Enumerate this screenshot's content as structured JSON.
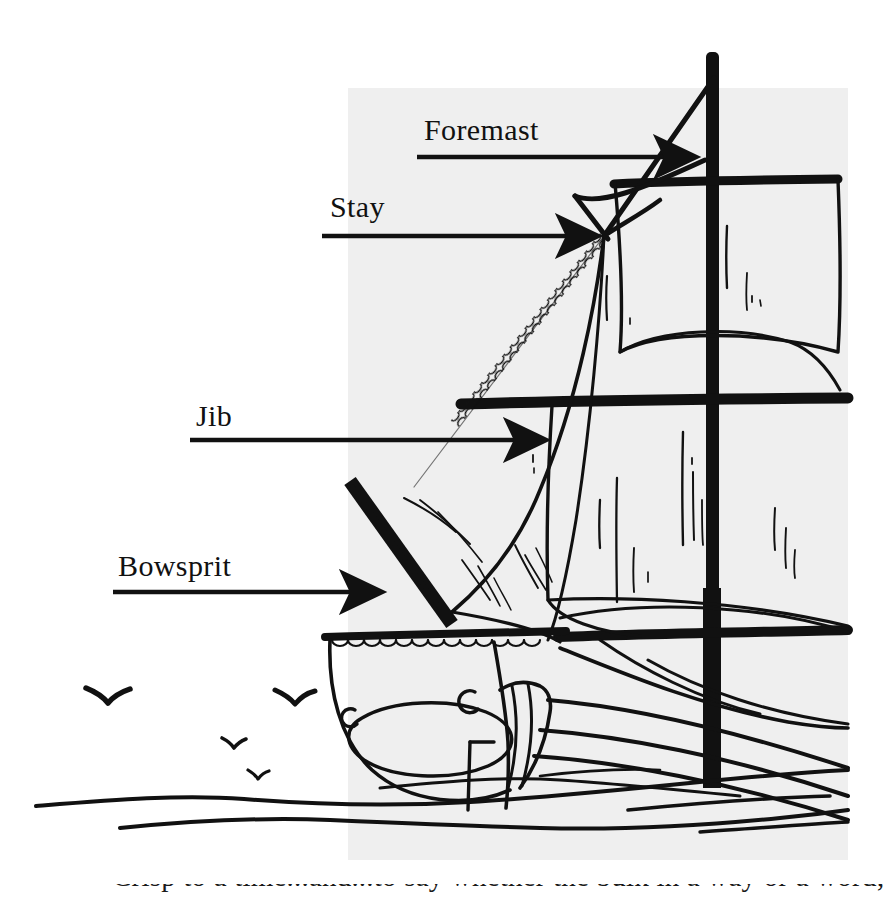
{
  "figure": {
    "panel": {
      "background_color": "#efefef",
      "x": 348,
      "y": 88,
      "width": 500,
      "height": 772
    },
    "page_background_color": "#ffffff",
    "ink_color": "#111111"
  },
  "annotations": [
    {
      "id": "foremast",
      "label": "Foremast",
      "label_x": 424,
      "label_y": 115,
      "leader_x1": 417,
      "leader_y1": 157,
      "leader_x2": 705,
      "leader_y2": 157,
      "arrow_direction": "right"
    },
    {
      "id": "stay",
      "label": "Stay",
      "label_x": 330,
      "label_y": 192,
      "leader_x1": 322,
      "leader_y1": 236,
      "leader_x2": 604,
      "leader_y2": 236,
      "arrow_direction": "right"
    },
    {
      "id": "jib",
      "label": "Jib",
      "label_x": 196,
      "label_y": 401,
      "leader_x1": 190,
      "leader_y1": 440,
      "leader_x2": 556,
      "leader_y2": 440,
      "arrow_direction": "right"
    },
    {
      "id": "bowsprit",
      "label": "Bowsprit",
      "label_x": 118,
      "label_y": 551,
      "leader_x1": 113,
      "leader_y1": 592,
      "leader_x2": 392,
      "leader_y2": 592,
      "arrow_direction": "right"
    }
  ],
  "scene": {
    "birds": [
      {
        "x": 85,
        "y": 690,
        "size": 30
      },
      {
        "x": 274,
        "y": 692,
        "size": 26
      },
      {
        "x": 222,
        "y": 738,
        "size": 17
      },
      {
        "x": 247,
        "y": 771,
        "size": 14
      }
    ],
    "bird_count": 4,
    "water_line_count": 5,
    "sail_count": 3,
    "mast_count": 1,
    "yard_count": 4
  },
  "caption": {
    "partial_line": "Crisp to a time...and...to say whether the bulk in a way or a word;"
  }
}
